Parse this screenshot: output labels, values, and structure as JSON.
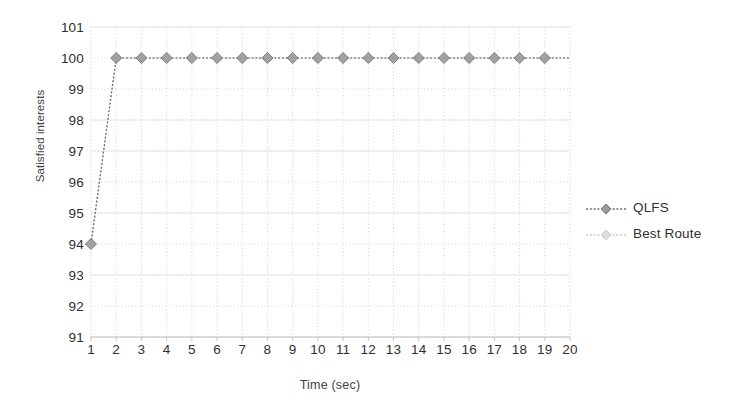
{
  "chart_data": {
    "type": "line",
    "title": "",
    "xlabel": "Time (sec)",
    "ylabel": "Satisfied interests",
    "xlim": [
      1,
      20
    ],
    "ylim": [
      91,
      101
    ],
    "xticks": [
      1,
      2,
      3,
      4,
      5,
      6,
      7,
      8,
      9,
      10,
      11,
      12,
      13,
      14,
      15,
      16,
      17,
      18,
      19,
      20
    ],
    "yticks": [
      91,
      92,
      93,
      94,
      95,
      96,
      97,
      98,
      99,
      100,
      101
    ],
    "grid": true,
    "grid_style": "dotted-horizontal-and-vertical",
    "legend_position": "right",
    "x": [
      1,
      2,
      3,
      4,
      5,
      6,
      7,
      8,
      9,
      10,
      11,
      12,
      13,
      14,
      15,
      16,
      17,
      18,
      19,
      20
    ],
    "series": [
      {
        "name": "QLFS",
        "color": "#6e6e6e",
        "marker": "diamond",
        "linestyle": "dashed",
        "values": [
          94,
          100,
          100,
          100,
          100,
          100,
          100,
          100,
          100,
          100,
          100,
          100,
          100,
          100,
          100,
          100,
          100,
          100,
          100,
          100
        ]
      },
      {
        "name": "Best Route",
        "color": "#c8c8c8",
        "marker": "diamond",
        "linestyle": "dashed",
        "values": [
          94,
          100,
          100,
          100,
          100,
          100,
          100,
          100,
          100,
          100,
          100,
          100,
          100,
          100,
          100,
          100,
          100,
          100,
          100,
          100
        ]
      }
    ]
  },
  "axes": {
    "y_title": "Satisfied interests",
    "x_title": "Time (sec)",
    "y_tick_labels": [
      "101",
      "100",
      "99",
      "98",
      "97",
      "96",
      "95",
      "94",
      "93",
      "92",
      "91"
    ],
    "x_tick_labels": [
      "1",
      "2",
      "3",
      "4",
      "5",
      "6",
      "7",
      "8",
      "9",
      "10",
      "11",
      "12",
      "13",
      "14",
      "15",
      "16",
      "17",
      "18",
      "19",
      "20"
    ]
  },
  "legend": {
    "items": [
      {
        "label": "QLFS",
        "color": "#6e6e6e"
      },
      {
        "label": "Best Route",
        "color": "#c9c9c9"
      }
    ]
  },
  "colors": {
    "background": "#ffffff",
    "text": "#2f2f2f",
    "gridline": "#cfcfcf",
    "axis": "#c4c4c4",
    "series_primary": "#6e6e6e",
    "series_secondary": "#c8c8c8"
  }
}
